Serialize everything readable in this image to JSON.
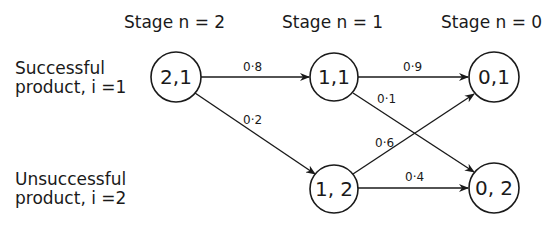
{
  "stages": [
    {
      "label": "Stage  n = 2"
    },
    {
      "label": "Stage  n = 1"
    },
    {
      "label": "Stage  n = 0"
    }
  ],
  "rows": [
    {
      "line1": "Successful",
      "line2": "product,  i =1"
    },
    {
      "line1": "Unsuccessful",
      "line2": "product,  i =2"
    }
  ],
  "nodes": [
    {
      "id": "2,1",
      "label": "2,1"
    },
    {
      "id": "1,1",
      "label": "1,1"
    },
    {
      "id": "1,2",
      "label": "1, 2"
    },
    {
      "id": "0,1",
      "label": "0,1"
    },
    {
      "id": "0,2",
      "label": "0, 2"
    }
  ],
  "edges": [
    {
      "from": "2,1",
      "to": "1,1",
      "probability": "0·8"
    },
    {
      "from": "2,1",
      "to": "1,2",
      "probability": "0·2"
    },
    {
      "from": "1,1",
      "to": "0,1",
      "probability": "0·9"
    },
    {
      "from": "1,1",
      "to": "0,2",
      "probability": "0·1"
    },
    {
      "from": "1,2",
      "to": "0,1",
      "probability": "0·6"
    },
    {
      "from": "1,2",
      "to": "0,2",
      "probability": "0·4"
    }
  ],
  "colors": {
    "stroke": "#1a1a1a",
    "background": "#ffffff"
  }
}
